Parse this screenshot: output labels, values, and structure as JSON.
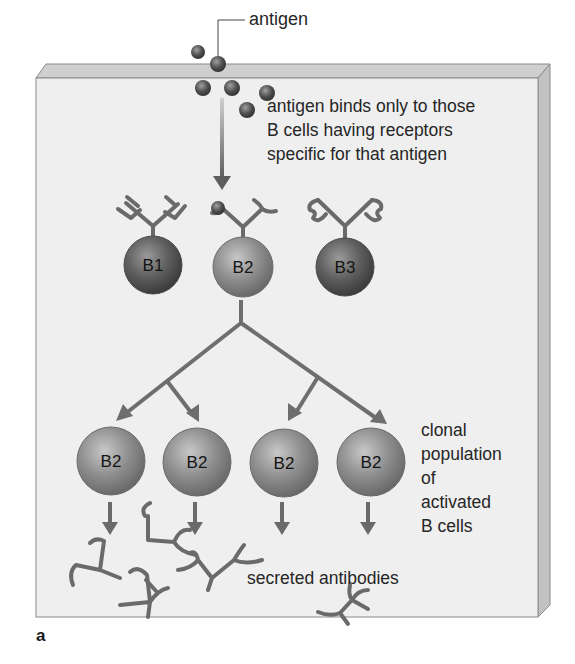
{
  "figure": {
    "panel_label": "a",
    "labels": {
      "antigen": "antigen",
      "binding_note": [
        "antigen binds only to those",
        "B cells having receptors",
        "specific for that antigen"
      ],
      "clonal_note": [
        "clonal",
        "population",
        "of",
        "activated",
        "B cells"
      ],
      "secreted": "secreted antibodies"
    },
    "initial_cells": [
      {
        "label": "B1",
        "receptor": "square-tipped"
      },
      {
        "label": "B2",
        "receptor": "curved-tipped (antigen bound)"
      },
      {
        "label": "B3",
        "receptor": "wavy-tipped"
      }
    ],
    "clone_cells": [
      {
        "label": "B2"
      },
      {
        "label": "B2"
      },
      {
        "label": "B2"
      },
      {
        "label": "B2"
      }
    ],
    "colors": {
      "panel_face": "#efefef",
      "panel_edge": "#c9c9c9",
      "arrow": "#6e6e6e",
      "cell_dark": "#5b5b5b",
      "cell_light": "#9a9a9a",
      "antigen": "#505050",
      "text": "#262626"
    }
  }
}
